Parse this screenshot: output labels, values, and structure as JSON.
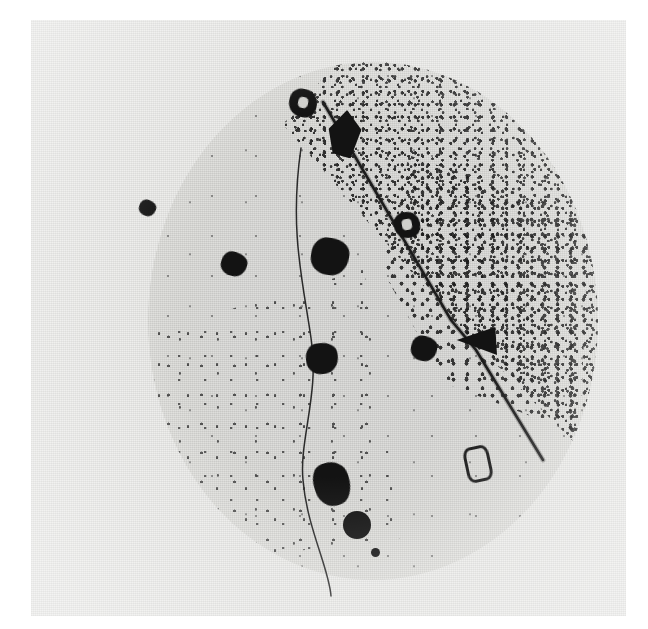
{
  "figure": {
    "domain": "Natural-Image",
    "kind": "photographic-micrograph",
    "caption": "",
    "background_color": "#ffffff",
    "print_color": "#ebebe9",
    "field_color": "#d9d9d6",
    "ink_color": "#131313"
  },
  "print": {
    "name": "photographic-print",
    "x": 31,
    "y": 20,
    "width": 595,
    "height": 596
  },
  "field": {
    "name": "circular-specimen-field",
    "center_x": 342,
    "center_y": 321,
    "radius_x": 225,
    "radius_y": 259
  },
  "regions": [
    {
      "name": "dense-speckle-sector",
      "label": "upper-right dense grain sector",
      "density": "high"
    },
    {
      "name": "moderate-speckle-sector",
      "label": "lower-left moderate grain sector",
      "density": "medium"
    },
    {
      "name": "clear-sector",
      "label": "left and lower-right clear sector",
      "density": "low"
    }
  ],
  "tracks": [
    {
      "name": "diagonal-track",
      "label": "straight diagonal track",
      "path": "M 292 82 L 420 300 L 445 330 L 512 440",
      "stroke": "#1c1c1c",
      "width": 2.6
    },
    {
      "name": "curved-track",
      "label": "curved track",
      "path": "M 270 128 C 258 210, 272 262, 280 318 C 289 372, 268 420, 272 460 C 276 508, 298 548, 300 576",
      "stroke": "#2a2a2a",
      "width": 1.5
    }
  ],
  "spots": [
    {
      "name": "spot-ring-top",
      "shape": "ring",
      "x": 258,
      "y": 69,
      "w": 28,
      "h": 28,
      "rot": 12
    },
    {
      "name": "spot-diamond-top",
      "shape": "diamond",
      "x": 295,
      "y": 90,
      "w": 38,
      "h": 48,
      "rot": 5
    },
    {
      "name": "spot-small-left",
      "shape": "blob",
      "x": 108,
      "y": 180,
      "w": 17,
      "h": 16,
      "rot": 20
    },
    {
      "name": "spot-ring-diagonal",
      "shape": "ring",
      "x": 363,
      "y": 192,
      "w": 26,
      "h": 26,
      "rot": -10
    },
    {
      "name": "spot-pentagon-mid",
      "shape": "blob",
      "x": 280,
      "y": 218,
      "w": 38,
      "h": 37,
      "rot": 8
    },
    {
      "name": "spot-square-left",
      "shape": "blob",
      "x": 190,
      "y": 232,
      "w": 26,
      "h": 24,
      "rot": 15
    },
    {
      "name": "spot-mid-center",
      "shape": "blob",
      "x": 275,
      "y": 323,
      "w": 32,
      "h": 31,
      "rot": -8
    },
    {
      "name": "spot-mid-right",
      "shape": "blob",
      "x": 380,
      "y": 316,
      "w": 26,
      "h": 25,
      "rot": 10
    },
    {
      "name": "spot-triangle",
      "shape": "triangle",
      "x": 424,
      "y": 305,
      "w": 42,
      "h": 34,
      "rot": 0
    },
    {
      "name": "spot-hollow-rect",
      "shape": "hollow",
      "x": 434,
      "y": 426,
      "w": 20,
      "h": 30,
      "rot": -12
    },
    {
      "name": "spot-elongated-low",
      "shape": "blob",
      "x": 283,
      "y": 442,
      "w": 36,
      "h": 44,
      "rot": -18
    },
    {
      "name": "spot-round-low",
      "shape": "round",
      "x": 312,
      "y": 491,
      "w": 28,
      "h": 28,
      "rot": 0
    },
    {
      "name": "spot-tiny-low",
      "shape": "round",
      "x": 340,
      "y": 528,
      "w": 9,
      "h": 9,
      "rot": 0
    }
  ]
}
